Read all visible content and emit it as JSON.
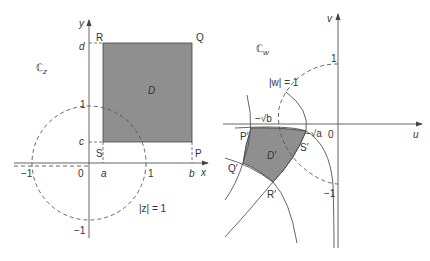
{
  "left_panel": {
    "plane_label": "ℂ",
    "plane_sub": "z",
    "axis_x": "x",
    "axis_y": "y",
    "region_label": "D",
    "corners": {
      "R": "R",
      "Q": "Q",
      "S": "S",
      "P": "P"
    },
    "ticks": {
      "a": "a",
      "b": "b",
      "c": "c",
      "d": "d",
      "one_x": "1",
      "neg_one_x": "−1",
      "origin": "0",
      "one_y": "1",
      "neg_one_y": "−1"
    },
    "circle_label": "|z| = 1"
  },
  "right_panel": {
    "plane_label": "ℂ",
    "plane_sub": "w",
    "axis_u": "u",
    "axis_v": "v",
    "region_label": "D′",
    "corners": {
      "P": "P′",
      "Q": "Q′",
      "R": "R′",
      "S": "S′"
    },
    "ticks": {
      "neg_sqrt_b": "−√b",
      "neg_sqrt_a": "−√a",
      "origin": "0",
      "one_v": "1",
      "neg_one_v": "−1"
    },
    "circle_label": "|w| = 1"
  },
  "colors": {
    "fill": "#8f8f8f",
    "line": "#555555",
    "text": "#333333"
  }
}
